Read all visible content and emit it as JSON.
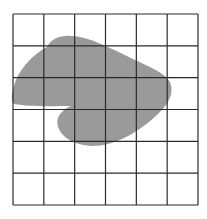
{
  "diagram": {
    "type": "area-estimation-grid",
    "grid": {
      "columns": 6,
      "rows": 6,
      "left": 13,
      "top": 14,
      "right": 198,
      "bottom": 205,
      "line_color": "#2a2a2a",
      "background": "#ffffff"
    },
    "shape": {
      "name": "irregular-blob",
      "fill": "#9a9a9a",
      "path": "M 47 47 C 52 38, 60 35, 72 36 C 90 37, 110 48, 135 60 C 150 67, 165 73, 170 82 C 174 92, 170 102, 160 112 C 148 124, 130 138, 108 144 C 92 148, 76 146, 64 136 C 56 128, 55 118, 62 112 C 66 108, 70 106, 72 106 C 55 106, 30 107, 14 104 C 10 100, 12 90, 16 80 C 22 66, 34 54, 47 47 Z"
    }
  }
}
